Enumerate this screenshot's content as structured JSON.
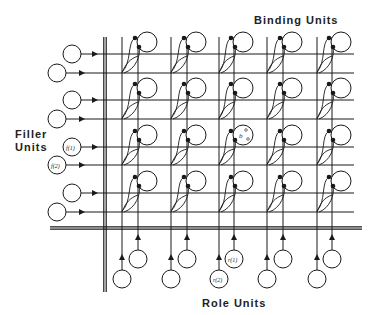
{
  "labels": {
    "binding_units": "Binding Units",
    "filler_units_line1": "Filler",
    "filler_units_line2": "Units",
    "role_units": "Role Units"
  },
  "colors": {
    "ink": "#1a1a1a",
    "background": "#ffffff"
  },
  "layout": {
    "vertical_bus_x": 105,
    "vertical_bus_top": 37,
    "vertical_bus_bottom": 292,
    "horizontal_bus_y": 228,
    "horizontal_bus_left": 50,
    "horizontal_bus_right": 362,
    "unit_radius": 9
  },
  "filler_units": [
    {
      "row_y": 54,
      "cx": 72,
      "symbol": ""
    },
    {
      "row_y": 73,
      "cx": 57,
      "symbol": ""
    },
    {
      "row_y": 100,
      "cx": 72,
      "symbol": ""
    },
    {
      "row_y": 119,
      "cx": 57,
      "symbol": ""
    },
    {
      "row_y": 147,
      "cx": 72,
      "symbol": "f(1)"
    },
    {
      "row_y": 165,
      "cx": 57,
      "symbol": "f(2)"
    },
    {
      "row_y": 193,
      "cx": 72,
      "symbol": ""
    },
    {
      "row_y": 212,
      "cx": 57,
      "symbol": ""
    }
  ],
  "role_units": [
    {
      "col_x": 122,
      "cy": 279,
      "symbol": ""
    },
    {
      "col_x": 138,
      "cy": 259,
      "symbol": ""
    },
    {
      "col_x": 171,
      "cy": 279,
      "symbol": ""
    },
    {
      "col_x": 187,
      "cy": 259,
      "symbol": ""
    },
    {
      "col_x": 219,
      "cy": 279,
      "symbol": "r(2)"
    },
    {
      "col_x": 234,
      "cy": 259,
      "symbol": "r(1)"
    },
    {
      "col_x": 267,
      "cy": 279,
      "symbol": ""
    },
    {
      "col_x": 283,
      "cy": 259,
      "symbol": ""
    },
    {
      "col_x": 317,
      "cy": 279,
      "symbol": ""
    },
    {
      "col_x": 332,
      "cy": 259,
      "symbol": ""
    }
  ],
  "binding_grid": {
    "rows": 4,
    "cols": 5,
    "highlighted": {
      "row": 2,
      "col": 2,
      "symbol": "b"
    }
  }
}
